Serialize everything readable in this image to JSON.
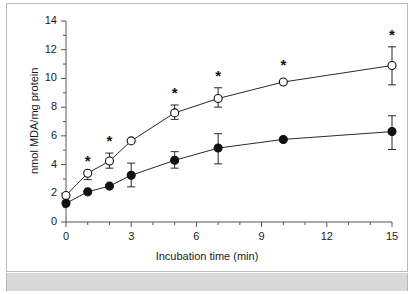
{
  "figure": {
    "background": "#ffffff",
    "frame_border_color": "#b9b9b9",
    "footer_band_color": "#d9d9d9",
    "axis_color": "#555555",
    "ink_color": "#111111"
  },
  "chart_data": {
    "type": "line",
    "title": "",
    "subtitle": "",
    "xlabel": "Incubation time (min)",
    "ylabel": "nmol MDA/mg protein",
    "xlim": [
      0,
      15
    ],
    "ylim": [
      0,
      14
    ],
    "xticks": [
      0,
      3,
      6,
      9,
      12,
      15
    ],
    "xtick_labels": [
      "0",
      "3",
      "6",
      "9",
      "12",
      "15"
    ],
    "xminorticks": [
      1,
      2,
      4,
      5,
      7,
      8,
      10,
      11,
      13,
      14
    ],
    "yticks": [
      0,
      2,
      4,
      6,
      8,
      10,
      12,
      14
    ],
    "ytick_labels": [
      "0",
      "2",
      "4",
      "6",
      "8",
      "10",
      "12",
      "14"
    ],
    "yminorticks": [
      1,
      3,
      5,
      7,
      9,
      11,
      13
    ],
    "grid": false,
    "legend": "none",
    "x": [
      0,
      1,
      2,
      3,
      5,
      7,
      10,
      15
    ],
    "series": [
      {
        "name": "open-circle-series",
        "marker": "open-circle",
        "values": [
          1.85,
          3.4,
          4.25,
          5.65,
          7.6,
          8.6,
          9.75,
          10.9
        ],
        "err_low": [
          0,
          0.45,
          0.5,
          0,
          0.45,
          0.6,
          0,
          1.35
        ],
        "err_high": [
          0,
          0.0,
          0.55,
          0,
          0.55,
          0.75,
          0,
          1.3
        ],
        "significance": [
          "",
          "*",
          "*",
          "",
          "*",
          "*",
          "*",
          "*"
        ]
      },
      {
        "name": "filled-circle-series",
        "marker": "filled-circle",
        "values": [
          1.3,
          2.1,
          2.5,
          3.25,
          4.3,
          5.15,
          5.75,
          6.3
        ],
        "err_low": [
          0,
          0,
          0,
          0.8,
          0.55,
          1.1,
          0,
          1.25
        ],
        "err_high": [
          0,
          0,
          0,
          0.85,
          0.6,
          1.0,
          0,
          1.1
        ],
        "significance": [
          "",
          "",
          "",
          "",
          "",
          "",
          "",
          ""
        ]
      }
    ],
    "annotations": {
      "significance_marker": "*",
      "significance_note": ""
    }
  }
}
